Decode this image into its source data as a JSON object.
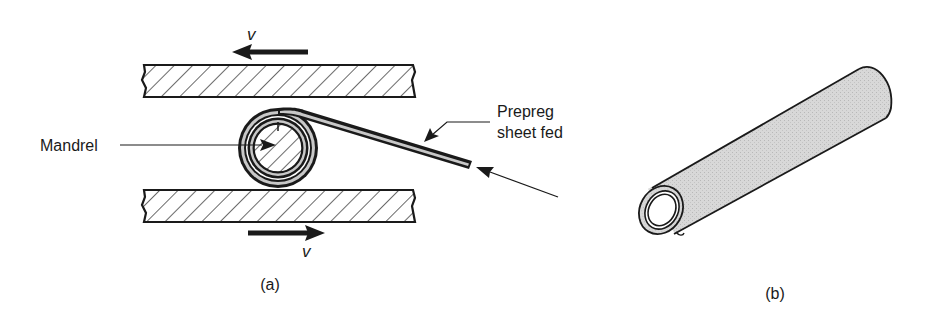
{
  "figure": {
    "panel_a": {
      "caption": "(a)",
      "labels": {
        "mandrel": "Mandrel",
        "prepreg_line1": "Prepreg",
        "prepreg_line2": "sheet fed",
        "velocity_top": "v",
        "velocity_bottom": "v"
      },
      "upper_plate_motion": "left",
      "lower_plate_motion": "right"
    },
    "panel_b": {
      "caption": "(b)",
      "subject": "rolled tube"
    },
    "colors": {
      "ink": "#1a1a1a",
      "sheet_fill": "#c8c8c8",
      "tube_fill": "#d6d6d6",
      "background": "#ffffff"
    }
  }
}
